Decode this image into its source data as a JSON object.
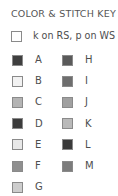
{
  "title": "COLOR & STITCH KEY",
  "stitch_key": {
    "label": "k on RS, p on WS",
    "swatch_color": "#ffffff"
  },
  "colors_left": [
    {
      "label": "A",
      "color": "#3f3f3f"
    },
    {
      "label": "B",
      "color": "#f2f2f2"
    },
    {
      "label": "C",
      "color": "#b4b4b4"
    },
    {
      "label": "D",
      "color": "#3c3c3c"
    },
    {
      "label": "E",
      "color": "#e8e8e8"
    },
    {
      "label": "F",
      "color": "#8f8f8f"
    },
    {
      "label": "G",
      "color": "#cdcdcd"
    }
  ],
  "colors_right": [
    {
      "label": "H",
      "color": "#5a5a5a"
    },
    {
      "label": "I",
      "color": "#6e6e6e"
    },
    {
      "label": "J",
      "color": "#a0a0a0"
    },
    {
      "label": "K",
      "color": "#b9b9b9"
    },
    {
      "label": "L",
      "color": "#3a3a3a"
    },
    {
      "label": "M",
      "color": "#7c7c7c"
    }
  ]
}
